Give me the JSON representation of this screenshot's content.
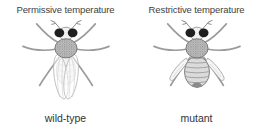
{
  "figure": {
    "panels": [
      {
        "condition_label": "Permissive temperature",
        "genotype_label": "wild-type",
        "illustration_icon": "wild-type-fly-icon"
      },
      {
        "condition_label": "Restrictive temperature",
        "genotype_label": "mutant",
        "illustration_icon": "mutant-fly-icon"
      }
    ],
    "colors": {
      "background": "#ffffff",
      "label_text": "#3e3e3e",
      "fly_eye": "#1f1f1f",
      "fly_outline": "#7a7a7a",
      "thorax_fill": "#c2c2c2",
      "abdomen_fill_mutant": "#dbdbdb",
      "abdomen_fill_wildtype": "#f0f0f0",
      "wing_stroke": "#b5b5b5",
      "vestigial_wing_fill": "#f5f5f5",
      "leg_stroke": "#9b9b9b"
    }
  }
}
